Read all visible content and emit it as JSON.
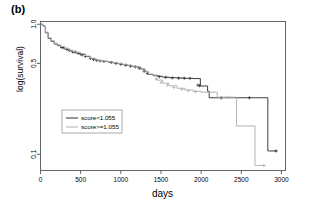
{
  "panel": {
    "label": "(b)"
  },
  "chart_data": {
    "type": "line",
    "title": "",
    "subtitle": "",
    "xlabel": "days",
    "ylabel": "log(survival)",
    "yscale": "log",
    "grid": false,
    "xlim": [
      0,
      3050
    ],
    "ylim": [
      0.075,
      1.05
    ],
    "xticks": [
      0,
      500,
      1000,
      1500,
      2000,
      2500,
      3000
    ],
    "xticklabels": [
      "0",
      "500",
      "1000",
      "1500",
      "2000",
      "2500",
      "3000"
    ],
    "yticks": [
      1.0,
      0.5,
      0.1
    ],
    "yticklabels": [
      "1.0",
      "0.5",
      "0.1"
    ],
    "legend": {
      "position": "center-left",
      "entries": [
        {
          "label": "score<1.055",
          "color": "#333333"
        },
        {
          "label": "score>=1.055",
          "color": "#b0b0b0"
        }
      ]
    },
    "series": [
      {
        "name": "score<1.055",
        "color": "#333333",
        "style": "step",
        "points": [
          [
            0,
            1.0
          ],
          [
            30,
            0.97
          ],
          [
            60,
            0.86
          ],
          [
            95,
            0.78
          ],
          [
            130,
            0.74
          ],
          [
            170,
            0.705
          ],
          [
            210,
            0.685
          ],
          [
            250,
            0.665
          ],
          [
            300,
            0.645
          ],
          [
            350,
            0.625
          ],
          [
            400,
            0.612
          ],
          [
            450,
            0.6
          ],
          [
            500,
            0.585
          ],
          [
            560,
            0.565
          ],
          [
            620,
            0.545
          ],
          [
            680,
            0.53
          ],
          [
            720,
            0.525
          ],
          [
            780,
            0.518
          ],
          [
            840,
            0.512
          ],
          [
            900,
            0.505
          ],
          [
            960,
            0.498
          ],
          [
            1020,
            0.49
          ],
          [
            1080,
            0.482
          ],
          [
            1140,
            0.474
          ],
          [
            1200,
            0.468
          ],
          [
            1250,
            0.452
          ],
          [
            1300,
            0.432
          ],
          [
            1340,
            0.412
          ],
          [
            1400,
            0.405
          ],
          [
            1460,
            0.398
          ],
          [
            1520,
            0.392
          ],
          [
            1600,
            0.388
          ],
          [
            1700,
            0.386
          ],
          [
            1800,
            0.384
          ],
          [
            1900,
            0.382
          ],
          [
            1990,
            0.335
          ],
          [
            2080,
            0.305
          ],
          [
            2100,
            0.272
          ],
          [
            2400,
            0.272
          ],
          [
            2700,
            0.272
          ],
          [
            2820,
            0.272
          ],
          [
            2830,
            0.106
          ],
          [
            2950,
            0.106
          ]
        ],
        "censor_marks": [
          [
            265,
            0.662
          ],
          [
            290,
            0.66
          ],
          [
            330,
            0.642
          ],
          [
            360,
            0.63
          ],
          [
            400,
            0.614
          ],
          [
            430,
            0.612
          ],
          [
            470,
            0.598
          ],
          [
            505,
            0.585
          ],
          [
            520,
            0.583
          ],
          [
            560,
            0.566
          ],
          [
            620,
            0.546
          ],
          [
            660,
            0.535
          ],
          [
            700,
            0.527
          ],
          [
            740,
            0.523
          ],
          [
            790,
            0.517
          ],
          [
            880,
            0.508
          ],
          [
            940,
            0.5
          ],
          [
            1000,
            0.492
          ],
          [
            1060,
            0.484
          ],
          [
            1120,
            0.476
          ],
          [
            1180,
            0.47
          ],
          [
            1230,
            0.458
          ],
          [
            1290,
            0.436
          ],
          [
            1330,
            0.418
          ],
          [
            1480,
            0.395
          ],
          [
            1560,
            0.39
          ],
          [
            1640,
            0.387
          ],
          [
            1720,
            0.385
          ],
          [
            1790,
            0.384
          ],
          [
            1860,
            0.383
          ],
          [
            1960,
            0.34
          ],
          [
            1980,
            0.337
          ],
          [
            2250,
            0.272
          ],
          [
            2600,
            0.272
          ],
          [
            2930,
            0.106
          ]
        ]
      },
      {
        "name": "score>=1.055",
        "color": "#b0b0b0",
        "style": "step",
        "points": [
          [
            0,
            1.0
          ],
          [
            30,
            0.97
          ],
          [
            60,
            0.87
          ],
          [
            95,
            0.79
          ],
          [
            130,
            0.75
          ],
          [
            170,
            0.715
          ],
          [
            210,
            0.695
          ],
          [
            250,
            0.675
          ],
          [
            300,
            0.652
          ],
          [
            350,
            0.632
          ],
          [
            400,
            0.618
          ],
          [
            450,
            0.606
          ],
          [
            500,
            0.592
          ],
          [
            560,
            0.57
          ],
          [
            620,
            0.548
          ],
          [
            680,
            0.532
          ],
          [
            720,
            0.527
          ],
          [
            780,
            0.52
          ],
          [
            840,
            0.514
          ],
          [
            900,
            0.507
          ],
          [
            960,
            0.5
          ],
          [
            1020,
            0.492
          ],
          [
            1080,
            0.484
          ],
          [
            1140,
            0.476
          ],
          [
            1200,
            0.47
          ],
          [
            1250,
            0.454
          ],
          [
            1300,
            0.434
          ],
          [
            1340,
            0.414
          ],
          [
            1400,
            0.4
          ],
          [
            1450,
            0.372
          ],
          [
            1520,
            0.352
          ],
          [
            1600,
            0.336
          ],
          [
            1700,
            0.322
          ],
          [
            1800,
            0.312
          ],
          [
            1900,
            0.305
          ],
          [
            2000,
            0.3
          ],
          [
            2100,
            0.3
          ],
          [
            2200,
            0.275
          ],
          [
            2430,
            0.275
          ],
          [
            2440,
            0.165
          ],
          [
            2660,
            0.165
          ],
          [
            2670,
            0.082
          ],
          [
            2800,
            0.082
          ]
        ],
        "censor_marks": [
          [
            1440,
            0.378
          ],
          [
            1500,
            0.356
          ],
          [
            1580,
            0.34
          ],
          [
            1660,
            0.326
          ],
          [
            1760,
            0.316
          ],
          [
            1840,
            0.308
          ],
          [
            1930,
            0.303
          ],
          [
            2320,
            0.275
          ],
          [
            2780,
            0.082
          ]
        ]
      }
    ]
  }
}
